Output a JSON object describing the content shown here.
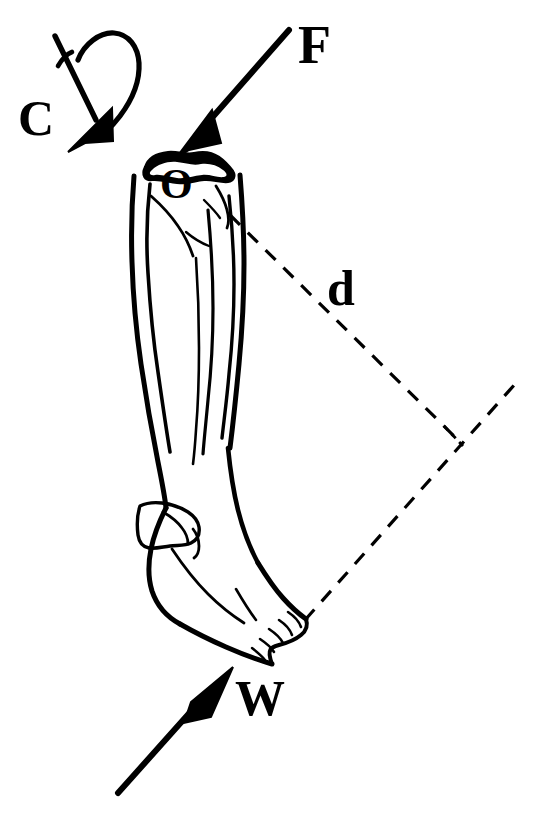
{
  "figure": {
    "kind": "free-body-diagram",
    "background_color": "#ffffff",
    "ink_color": "#000000",
    "width": 534,
    "height": 814
  },
  "labels": {
    "force_applied": "F",
    "couple_moment": "C",
    "moment_arm": "d",
    "weight_reaction": "W",
    "joint_center": "O"
  },
  "vectors": [
    {
      "name": "F",
      "label": "F",
      "meaning": "applied force at knee joint",
      "style": "solid-arrow",
      "direction": "down-left",
      "tail": [
        289,
        30
      ],
      "tip": [
        178,
        156
      ]
    },
    {
      "name": "C",
      "label": "C",
      "meaning": "couple / rotational moment at knee",
      "style": "solid-arrow-with-curved-loop",
      "direction": "down-left",
      "tail": [
        55,
        36
      ],
      "tip": [
        70,
        148
      ]
    },
    {
      "name": "W",
      "label": "W",
      "meaning": "weight / ground reaction force at forefoot",
      "style": "solid-arrow",
      "direction": "up-right",
      "tail": [
        118,
        793
      ],
      "tip": [
        232,
        668
      ]
    },
    {
      "name": "d",
      "label": "d",
      "meaning": "moment arm, perpendicular distance from O to line of action of W",
      "style": "dashed-line",
      "tail": [
        230,
        215
      ],
      "tip": [
        455,
        437
      ]
    }
  ],
  "construction_lines": [
    {
      "name": "line-of-action-W-extension",
      "style": "dashed",
      "from": [
        305,
        620
      ],
      "to": [
        516,
        383
      ]
    },
    {
      "name": "right-angle-tick",
      "style": "dashed",
      "at": [
        455,
        437
      ],
      "meaning": "perpendicular intersection marker"
    }
  ],
  "anatomy": {
    "parts": [
      "tibia",
      "fibula",
      "tibial plateau",
      "medial malleolus",
      "lateral malleolus",
      "talus",
      "calcaneus",
      "foot",
      "toes"
    ],
    "orientation": "leg tilted, toes pointing lower-right"
  }
}
